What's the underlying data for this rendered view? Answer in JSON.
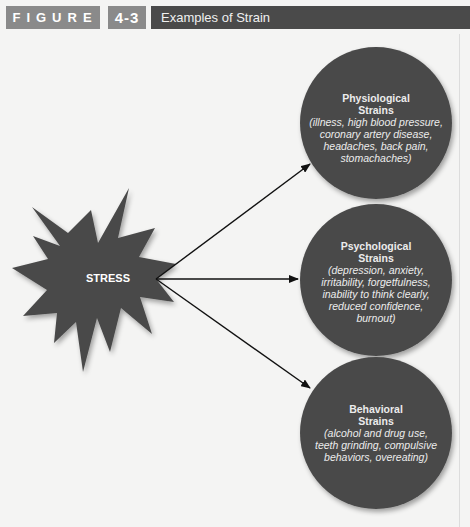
{
  "header": {
    "figure_label": "FIGURE",
    "figure_number": "4-3",
    "figure_title": "Examples of Strain"
  },
  "diagram": {
    "source": {
      "label": "STRESS",
      "shape": "starburst"
    },
    "colors": {
      "node_fill": "#4a4a4a",
      "arrow": "#111111",
      "text": "#ececec",
      "background": "#f4f4f3"
    },
    "targets": [
      {
        "title_line1": "Physiological",
        "title_line2": "Strains",
        "details": [
          "(illness, high blood pressure,",
          "coronary artery disease,",
          "headaches, back pain,",
          "stomachaches)"
        ]
      },
      {
        "title_line1": "Psychological",
        "title_line2": "Strains",
        "details": [
          "(depression, anxiety,",
          "irritability, forgetfulness,",
          "inability to think clearly,",
          "reduced confidence,",
          "burnout)"
        ]
      },
      {
        "title_line1": "Behavioral",
        "title_line2": "Strains",
        "details": [
          "(alcohol and drug use,",
          "teeth grinding, compulsive",
          "behaviors, overeating)"
        ]
      }
    ],
    "edges": [
      {
        "from": "STRESS",
        "to": "Physiological Strains"
      },
      {
        "from": "STRESS",
        "to": "Psychological Strains"
      },
      {
        "from": "STRESS",
        "to": "Behavioral Strains"
      }
    ]
  }
}
